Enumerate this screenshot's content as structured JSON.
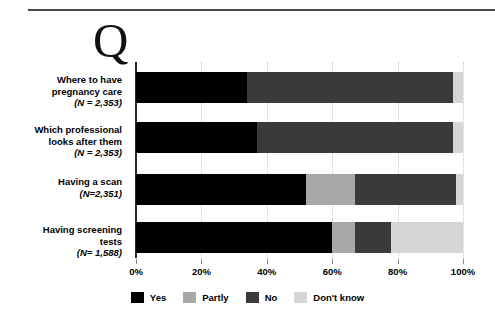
{
  "logo": {
    "glyph": "Q"
  },
  "legend": {
    "items": [
      {
        "label": "Yes",
        "color": "#000000"
      },
      {
        "label": "Partly",
        "color": "#a8a8a8"
      },
      {
        "label": "No",
        "color": "#3a3a3a"
      },
      {
        "label": "Don't know",
        "color": "#d6d6d6"
      }
    ]
  },
  "axis": {
    "ticks": [
      "0%",
      "20%",
      "40%",
      "60%",
      "80%",
      "100%"
    ],
    "tick_values": [
      0,
      20,
      40,
      60,
      80,
      100
    ]
  },
  "rows": [
    {
      "title_line1": "Where to have",
      "title_line2": "pregnancy care",
      "n_label": "(N = 2,353)"
    },
    {
      "title_line1": "Which professional",
      "title_line2": "looks after them",
      "n_label": "(N = 2,353)"
    },
    {
      "title_line1": "Having a scan",
      "title_line2": "",
      "n_label": "(N=2,351)"
    },
    {
      "title_line1": "Having screening",
      "title_line2": "tests",
      "n_label": "(N= 1,588)"
    }
  ],
  "chart_data": {
    "type": "bar",
    "orientation": "horizontal",
    "stacked": true,
    "stack_mode": "percent",
    "title": "",
    "xlabel": "",
    "ylabel": "",
    "xlim": [
      0,
      100
    ],
    "grid": true,
    "legend_position": "bottom",
    "categories": [
      "Where to have pregnancy care (N = 2,353)",
      "Which professional looks after them (N = 2,353)",
      "Having a scan (N=2,351)",
      "Having screening tests (N= 1,588)"
    ],
    "series": [
      {
        "name": "Yes",
        "color": "#000000",
        "values": [
          34,
          37,
          52,
          60
        ]
      },
      {
        "name": "Partly",
        "color": "#a8a8a8",
        "values": [
          0,
          0,
          15,
          7
        ]
      },
      {
        "name": "No",
        "color": "#3a3a3a",
        "values": [
          63,
          60,
          31,
          11
        ]
      },
      {
        "name": "Don't know",
        "color": "#d6d6d6",
        "values": [
          3,
          3,
          2,
          22
        ]
      }
    ]
  }
}
